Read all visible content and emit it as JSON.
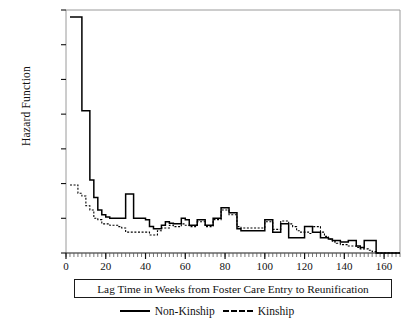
{
  "chart_data": {
    "type": "line",
    "title": "",
    "xlabel": "Lag Time in Weeks from Foster Care Entry to Reunification",
    "ylabel": "Hazard Function",
    "xlim": [
      0,
      168
    ],
    "ylim": [
      0,
      0.035
    ],
    "xticks": [
      0,
      20,
      40,
      60,
      80,
      100,
      120,
      140,
      160
    ],
    "xtick_labels": [
      "0",
      "20",
      "40",
      "60",
      "80",
      "100",
      "120",
      "140",
      "160"
    ],
    "yticks": [
      0,
      0.005,
      0.01,
      0.015,
      0.02,
      0.025,
      0.03,
      0.035
    ],
    "ytick_labels": [
      "0",
      "0.005",
      "0.01",
      "0.015",
      "0.02",
      "0.025",
      "0.03",
      "0.035"
    ],
    "grid": false,
    "minor_xticks_interval": 2,
    "legend_position": "below-axis",
    "step_style": "post",
    "series": [
      {
        "name": "Non-Kinship",
        "style": "solid",
        "color": "#000000",
        "x": [
          2,
          4,
          6,
          8,
          10,
          12,
          14,
          16,
          18,
          20,
          22,
          24,
          26,
          28,
          30,
          32,
          34,
          36,
          38,
          40,
          42,
          44,
          46,
          48,
          50,
          52,
          54,
          56,
          58,
          60,
          62,
          64,
          66,
          68,
          70,
          72,
          74,
          76,
          78,
          80,
          82,
          84,
          86,
          88,
          90,
          92,
          94,
          96,
          98,
          100,
          102,
          104,
          106,
          108,
          110,
          112,
          114,
          116,
          118,
          120,
          122,
          124,
          126,
          128,
          130,
          132,
          134,
          136,
          138,
          140,
          142,
          144,
          146,
          148,
          150,
          152,
          154,
          156,
          158,
          160,
          162,
          164,
          166
        ],
        "y": [
          0.034,
          0.034,
          0.034,
          0.0205,
          0.0205,
          0.0105,
          0.008,
          0.0062,
          0.0055,
          0.0052,
          0.005,
          0.005,
          0.005,
          0.005,
          0.0085,
          0.0085,
          0.005,
          0.005,
          0.005,
          0.0048,
          0.0038,
          0.0035,
          0.0035,
          0.004,
          0.0045,
          0.0043,
          0.0042,
          0.0042,
          0.005,
          0.0048,
          0.004,
          0.004,
          0.0048,
          0.0048,
          0.004,
          0.004,
          0.005,
          0.005,
          0.0065,
          0.0065,
          0.0058,
          0.0058,
          0.0035,
          0.0032,
          0.0032,
          0.0032,
          0.0032,
          0.0032,
          0.0032,
          0.0048,
          0.0048,
          0.003,
          0.003,
          0.0042,
          0.0042,
          0.0022,
          0.0022,
          0.0022,
          0.0022,
          0.0038,
          0.0038,
          0.003,
          0.003,
          0.0022,
          0.0022,
          0.002,
          0.0018,
          0.0018,
          0.0016,
          0.0016,
          0.0018,
          0.0018,
          0.001,
          0.0008,
          0.0018,
          0.0018,
          0.0018,
          0.0,
          0.0,
          0.0,
          0.0,
          0.0,
          0.0
        ]
      },
      {
        "name": "Kinship",
        "style": "dashed",
        "color": "#000000",
        "x": [
          2,
          4,
          6,
          8,
          10,
          12,
          14,
          16,
          18,
          20,
          22,
          24,
          26,
          28,
          30,
          32,
          34,
          36,
          38,
          40,
          42,
          44,
          46,
          48,
          50,
          52,
          54,
          56,
          58,
          60,
          62,
          64,
          66,
          68,
          70,
          72,
          74,
          76,
          78,
          80,
          82,
          84,
          86,
          88,
          90,
          92,
          94,
          96,
          98,
          100,
          102,
          104,
          106,
          108,
          110,
          112,
          114,
          116,
          118,
          120,
          122,
          124,
          126,
          128,
          130,
          132,
          134,
          136,
          138,
          140,
          142,
          144,
          146,
          148,
          150,
          152,
          154,
          156,
          158,
          160,
          162,
          166
        ],
        "y": [
          0.0098,
          0.0098,
          0.0086,
          0.0082,
          0.0068,
          0.0062,
          0.005,
          0.0048,
          0.0042,
          0.0042,
          0.004,
          0.004,
          0.0038,
          0.0036,
          0.003,
          0.003,
          0.003,
          0.003,
          0.003,
          0.003,
          0.0026,
          0.0026,
          0.0032,
          0.0036,
          0.0036,
          0.004,
          0.0038,
          0.0038,
          0.0042,
          0.004,
          0.0038,
          0.0038,
          0.0045,
          0.0045,
          0.0038,
          0.0038,
          0.0048,
          0.0048,
          0.0062,
          0.0062,
          0.0055,
          0.0055,
          0.0038,
          0.0036,
          0.0036,
          0.0036,
          0.0036,
          0.0036,
          0.0036,
          0.0045,
          0.0045,
          0.0034,
          0.0034,
          0.0046,
          0.0046,
          0.0042,
          0.0038,
          0.0032,
          0.003,
          0.003,
          0.0028,
          0.0038,
          0.0038,
          0.003,
          0.0024,
          0.002,
          0.0016,
          0.0014,
          0.0012,
          0.0012,
          0.001,
          0.001,
          0.0008,
          0.0006,
          0.0006,
          0.0004,
          0.0002,
          0.0,
          0.0,
          0.0,
          0.0,
          0.0
        ]
      }
    ]
  },
  "legend": {
    "items": [
      {
        "label": "Non-Kinship",
        "style": "solid"
      },
      {
        "label": "Kinship",
        "style": "dashed"
      }
    ]
  }
}
